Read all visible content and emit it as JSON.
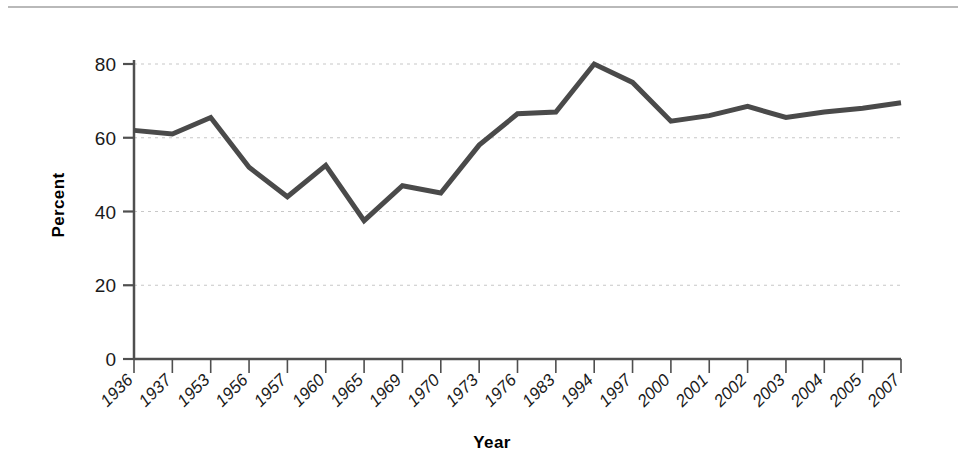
{
  "chart_data": {
    "type": "line",
    "title": "",
    "xlabel": "Year",
    "ylabel": "Percent",
    "categories": [
      "1936",
      "1937",
      "1953",
      "1956",
      "1957",
      "1960",
      "1965",
      "1969",
      "1970",
      "1973",
      "1976",
      "1983",
      "1994",
      "1997",
      "2000",
      "2001",
      "2002",
      "2003",
      "2004",
      "2005",
      "2007"
    ],
    "values": [
      62,
      61,
      65.5,
      52,
      44,
      52.5,
      37.5,
      47,
      45,
      58,
      66.5,
      67,
      80,
      75,
      64.5,
      66,
      68.5,
      65.5,
      67,
      68,
      69.5
    ],
    "series": [
      {
        "name": "Percent",
        "values": [
          62,
          61,
          65.5,
          52,
          44,
          52.5,
          37.5,
          47,
          45,
          58,
          66.5,
          67,
          80,
          75,
          64.5,
          66,
          68.5,
          65.5,
          67,
          68,
          69.5
        ]
      }
    ],
    "ylim": [
      0,
      80
    ],
    "yticks": [
      0,
      20,
      40,
      60,
      80
    ],
    "ytick_labels": [
      "0",
      "20",
      "40",
      "60",
      "80"
    ],
    "xlim_categories": 21,
    "grid": true,
    "grid_axis": "y",
    "grid_style": "dashed",
    "legend": false,
    "legend_position": "none",
    "line_color": "#4a4a4a",
    "line_width": 5,
    "grid_color": "#c8c8c8",
    "axis_color": "#4f4f4f",
    "background_color": "#ffffff"
  },
  "labels": {
    "x_axis_title": "Year",
    "y_axis_title": "Percent"
  }
}
